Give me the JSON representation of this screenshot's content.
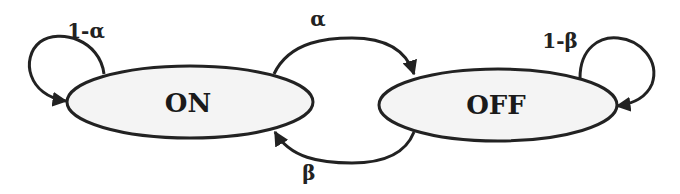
{
  "diagram": {
    "type": "state-transition",
    "colors": {
      "stroke": "#222222",
      "node_fill": "#f4f4f4",
      "background": "#ffffff"
    },
    "nodes": [
      {
        "id": "on",
        "label": "ON"
      },
      {
        "id": "off",
        "label": "OFF"
      }
    ],
    "edges": [
      {
        "from": "on",
        "to": "on",
        "label": "1-α"
      },
      {
        "from": "on",
        "to": "off",
        "label": "α"
      },
      {
        "from": "off",
        "to": "on",
        "label": "β"
      },
      {
        "from": "off",
        "to": "off",
        "label": "1-β"
      }
    ]
  }
}
